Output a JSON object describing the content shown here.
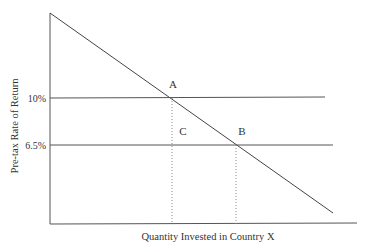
{
  "diagram": {
    "y_axis_label": "Pre-tax Rate of Return",
    "x_axis_label": "Quantity Invested in Country X",
    "y_ticks": [
      {
        "label": "10%",
        "value": 10
      },
      {
        "label": "6.5%",
        "value": 6.5
      }
    ],
    "points": [
      {
        "label": "A",
        "description": "intersection of demand curve and 10% line"
      },
      {
        "label": "B",
        "description": "intersection of demand curve and 6.5% line"
      },
      {
        "label": "C",
        "description": "point below A at 6.5% line"
      }
    ],
    "lines": {
      "demand_curve": "downward sloping marginal product of capital",
      "rate_10": "horizontal line at 10%",
      "rate_6_5": "horizontal line at 6.5%"
    },
    "colors": {
      "line": "#444444",
      "dotted": "#888888",
      "text": "#333333"
    }
  }
}
